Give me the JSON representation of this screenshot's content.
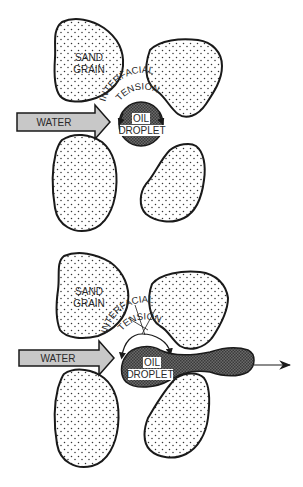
{
  "figure": {
    "panels": [
      {
        "id": "top",
        "caption_labels": {
          "sand_grain_line1": "SAND",
          "sand_grain_line2": "GRAIN",
          "tension_line1": "INTERFACIAL",
          "tension_line2": "TENSION",
          "water": "WATER",
          "oil_line1": "OIL",
          "oil_line2": "DROPLET"
        },
        "state": "droplet trapped between grains"
      },
      {
        "id": "bottom",
        "caption_labels": {
          "sand_grain_line1": "SAND",
          "sand_grain_line2": "GRAIN",
          "tension_line1": "INTERFACIAL",
          "tension_line2": "TENSION",
          "water": "WATER",
          "oil_line1": "OIL",
          "oil_line2": "DROPLET"
        },
        "state": "reduced tension, droplet elongates and flows through pore throat"
      }
    ],
    "colors": {
      "grain_outline": "#1a1a1a",
      "grain_fill": "#ffffff",
      "grain_dots": "#333333",
      "oil_fill": "#555555",
      "water_arrow_fill": "#c8c8c8",
      "label_bg": "#ffffff"
    }
  }
}
